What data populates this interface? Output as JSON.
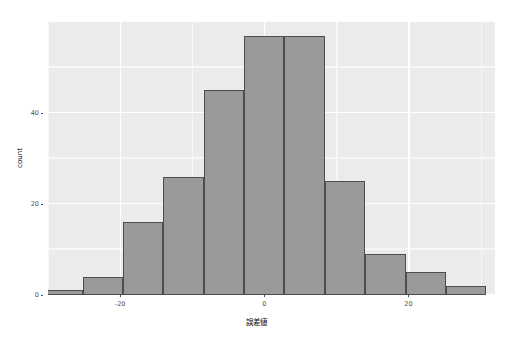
{
  "chart_data": {
    "type": "bar",
    "subtype": "histogram",
    "title": "",
    "subtitle": "",
    "xlabel": "誤差値",
    "ylabel": "count",
    "xlim": [
      -30,
      32
    ],
    "ylim": [
      0,
      60
    ],
    "xticks": [
      -20,
      0,
      20
    ],
    "xtick_labels": [
      "-20",
      "0",
      "20"
    ],
    "yticks": [
      0,
      20,
      40
    ],
    "ytick_labels": [
      "0",
      "20",
      "40"
    ],
    "x_minor_ticks": [
      -30,
      -10,
      10,
      30
    ],
    "y_minor_ticks": [
      10,
      30,
      50
    ],
    "grid": true,
    "legend": "none",
    "bin_width": 5.6,
    "bins": [
      {
        "left": -30.8,
        "right": -25.2,
        "center": -28.0,
        "count": 1
      },
      {
        "left": -25.2,
        "right": -19.6,
        "center": -22.4,
        "count": 4
      },
      {
        "left": -19.6,
        "right": -14.0,
        "center": -16.8,
        "count": 16
      },
      {
        "left": -14.0,
        "right": -8.4,
        "center": -11.2,
        "count": 26
      },
      {
        "left": -8.4,
        "right": -2.8,
        "center": -5.6,
        "count": 45
      },
      {
        "left": -2.8,
        "right": 2.8,
        "center": 0.0,
        "count": 57
      },
      {
        "left": 2.8,
        "right": 8.4,
        "center": 5.6,
        "count": 57
      },
      {
        "left": 8.4,
        "right": 14.0,
        "center": 11.2,
        "count": 25
      },
      {
        "left": 14.0,
        "right": 19.6,
        "center": 16.8,
        "count": 9
      },
      {
        "left": 19.6,
        "right": 25.2,
        "center": 22.4,
        "count": 5
      },
      {
        "left": 25.2,
        "right": 30.8,
        "center": 28.0,
        "count": 2
      }
    ],
    "categories": [
      "-28.0",
      "-22.4",
      "-16.8",
      "-11.2",
      "-5.6",
      "0.0",
      "5.6",
      "11.2",
      "16.8",
      "22.4",
      "28.0"
    ],
    "values": [
      1,
      4,
      16,
      26,
      45,
      57,
      57,
      25,
      9,
      5,
      2
    ]
  },
  "style": {
    "panel_background": "#ebebeb",
    "plot_background": "#ffffff",
    "grid_major_color": "#ffffff",
    "grid_minor_color": "#f7f7f7",
    "bar_fill": "#9a9a9a",
    "bar_outline": "#4d4d4d",
    "axis_text_color": "#4d4d4d",
    "axis_title_color": "#000000"
  }
}
